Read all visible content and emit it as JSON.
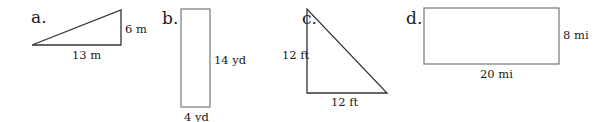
{
  "figures": [
    {
      "id": "a",
      "label": "a.",
      "shape": "right-triangle",
      "dimensions": {
        "height": "6 m",
        "base": "13 m"
      }
    },
    {
      "id": "b",
      "label": "b.",
      "shape": "rectangle",
      "dimensions": {
        "height": "14 yd",
        "width": "4 yd"
      }
    },
    {
      "id": "c",
      "label": "c.",
      "shape": "right-triangle",
      "dimensions": {
        "height": "12 ft",
        "base": "12 ft"
      }
    },
    {
      "id": "d",
      "label": "d.",
      "shape": "rectangle",
      "dimensions": {
        "height": "8 mi",
        "width": "20 mi"
      }
    }
  ],
  "colors": {
    "stroke_dark": "#333333",
    "stroke_rect": "#777777",
    "text": "#1a1a1a",
    "background": "#ffffff"
  }
}
